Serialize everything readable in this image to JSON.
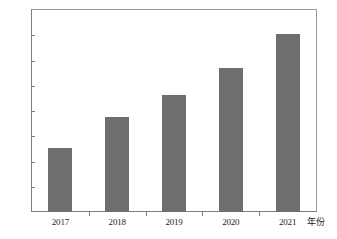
{
  "chart_data": {
    "type": "bar",
    "title": "",
    "subtitle": "",
    "xlabel": "年份",
    "ylabel": "",
    "categories": [
      "2017",
      "2018",
      "2019",
      "2020",
      "2021"
    ],
    "values": [
      1271,
      1295,
      1313,
      1334,
      1361
    ],
    "ylim": [
      1220,
      1380
    ],
    "ytick_values": [
      1220,
      1240,
      1260,
      1280,
      1300,
      1320,
      1340,
      1360,
      1380
    ],
    "ytick_labels": [
      "1220",
      "1240",
      "1260",
      "1280",
      "1300",
      "1320",
      "1340",
      "1360",
      "1380"
    ],
    "grid": false,
    "legend": null,
    "legend_position": "none",
    "series": [
      {
        "name": "",
        "values": [
          1271,
          1295,
          1313,
          1334,
          1361
        ],
        "color": "#6e6e6e"
      }
    ],
    "annotations": []
  },
  "style": {
    "bar_color": "#6e6e6e",
    "axis_color": "#7d7d7d",
    "frame_color": "#9a9a9a",
    "background": "#ffffff",
    "text_color": "#1b1b1b"
  }
}
